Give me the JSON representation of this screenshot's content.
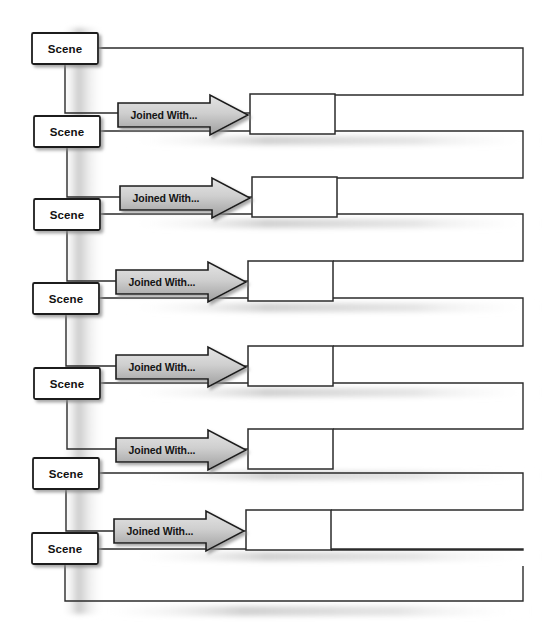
{
  "diagram": {
    "type": "flowchart",
    "canvas": {
      "width": 550,
      "height": 637,
      "background": "#ffffff"
    },
    "colors": {
      "stroke": "#2b2b2b",
      "node_fill": "#ffffff",
      "arrow_fill_top": "#dcdcdc",
      "arrow_fill_bottom": "#a8a8a8",
      "arrow_stroke": "#1c1c1c",
      "shadow": "#bdbdbd",
      "text": "#111111"
    },
    "scene_nodes": [
      {
        "id": "scene-1",
        "label": "Scene",
        "x": 32,
        "y": 33,
        "w": 66,
        "h": 31
      },
      {
        "id": "scene-2",
        "label": "Scene",
        "x": 34,
        "y": 116,
        "w": 66,
        "h": 31
      },
      {
        "id": "scene-3",
        "label": "Scene",
        "x": 34,
        "y": 199,
        "w": 66,
        "h": 31
      },
      {
        "id": "scene-4",
        "label": "Scene",
        "x": 33,
        "y": 283,
        "w": 66,
        "h": 31
      },
      {
        "id": "scene-5",
        "label": "Scene",
        "x": 34,
        "y": 368,
        "w": 66,
        "h": 31
      },
      {
        "id": "scene-6",
        "label": "Scene",
        "x": 33,
        "y": 458,
        "w": 66,
        "h": 31
      },
      {
        "id": "scene-7",
        "label": "Scene",
        "x": 32,
        "y": 533,
        "w": 66,
        "h": 31
      }
    ],
    "join_arrows": [
      {
        "id": "join-1",
        "label": "Joined With...",
        "x": 118,
        "y": 95,
        "w": 130,
        "h": 40
      },
      {
        "id": "join-2",
        "label": "Joined With...",
        "x": 120,
        "y": 178,
        "w": 130,
        "h": 40
      },
      {
        "id": "join-3",
        "label": "Joined With...",
        "x": 116,
        "y": 262,
        "w": 130,
        "h": 40
      },
      {
        "id": "join-4",
        "label": "Joined With...",
        "x": 116,
        "y": 347,
        "w": 130,
        "h": 40
      },
      {
        "id": "join-5",
        "label": "Joined With...",
        "x": 116,
        "y": 430,
        "w": 130,
        "h": 40
      },
      {
        "id": "join-6",
        "label": "Joined With...",
        "x": 114,
        "y": 511,
        "w": 130,
        "h": 40
      }
    ],
    "result_nodes": [
      {
        "id": "result-1",
        "label": "",
        "x": 250,
        "y": 94,
        "w": 85,
        "h": 40
      },
      {
        "id": "result-2",
        "label": "",
        "x": 252,
        "y": 177,
        "w": 85,
        "h": 40
      },
      {
        "id": "result-3",
        "label": "",
        "x": 248,
        "y": 261,
        "w": 85,
        "h": 40
      },
      {
        "id": "result-4",
        "label": "",
        "x": 248,
        "y": 346,
        "w": 85,
        "h": 40
      },
      {
        "id": "result-5",
        "label": "",
        "x": 248,
        "y": 429,
        "w": 85,
        "h": 40
      },
      {
        "id": "result-6",
        "label": "",
        "x": 246,
        "y": 510,
        "w": 85,
        "h": 40
      }
    ],
    "connectors": {
      "right_rail_x": 523,
      "description": "Each scene routes right to the rail, down, and back left into the next join result; each scene also drops down and right into the join arrow tail."
    }
  }
}
